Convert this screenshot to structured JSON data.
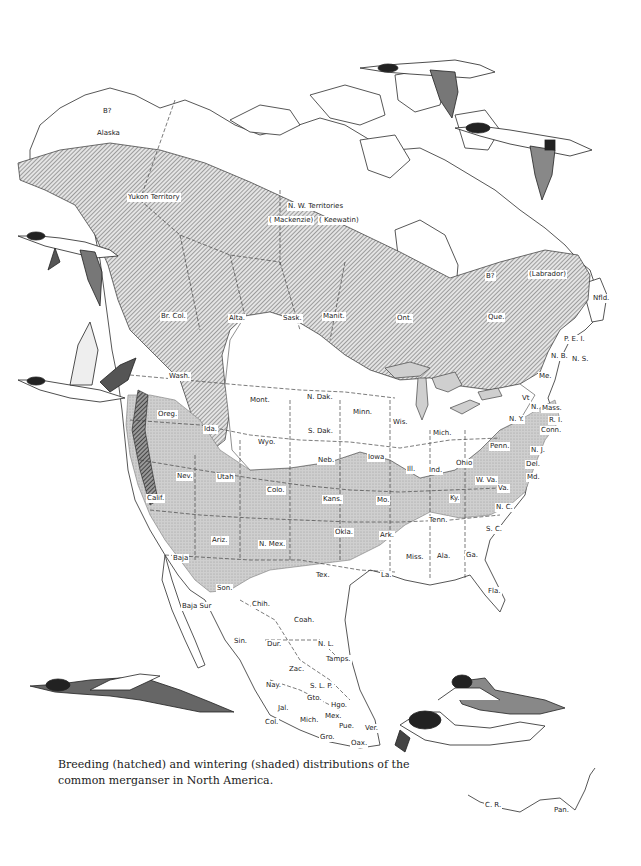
{
  "caption": {
    "line1": "Breeding (hatched) and wintering (shaded) distributions of the",
    "line2": "common merganser in North America."
  },
  "legend": {
    "breeding": {
      "label": "Breeding (hatched)",
      "pattern": "diagonal-hatch",
      "color": "#555555"
    },
    "wintering": {
      "label": "Wintering (shaded)",
      "pattern": "stipple-shade",
      "color": "#c8c8c8"
    }
  },
  "regions": {
    "canada_north": [
      {
        "id": "alaska_q",
        "text": "B?",
        "x": 102,
        "y": 107
      },
      {
        "id": "alaska",
        "text": "Alaska",
        "x": 96,
        "y": 129
      },
      {
        "id": "yukon",
        "text": "Yukon Territory",
        "x": 127,
        "y": 193
      },
      {
        "id": "nwt",
        "text": "N. W. Territories",
        "x": 287,
        "y": 202
      },
      {
        "id": "mackenzie",
        "text": "( Mackenzie)",
        "x": 268,
        "y": 216
      },
      {
        "id": "keewatin",
        "text": "( Keewatin)",
        "x": 318,
        "y": 216
      },
      {
        "id": "hudson_q",
        "text": "B?",
        "x": 485,
        "y": 272
      },
      {
        "id": "labrador",
        "text": "(Labrador)",
        "x": 528,
        "y": 270
      },
      {
        "id": "nfld",
        "text": "Nfld.",
        "x": 592,
        "y": 294
      }
    ],
    "canada_provinces": [
      {
        "id": "brcol",
        "text": "Br. Col.",
        "x": 160,
        "y": 312
      },
      {
        "id": "alta",
        "text": "Alta.",
        "x": 228,
        "y": 314
      },
      {
        "id": "sask",
        "text": "Sask.",
        "x": 282,
        "y": 314
      },
      {
        "id": "manit",
        "text": "Manit.",
        "x": 322,
        "y": 312
      },
      {
        "id": "ont",
        "text": "Ont.",
        "x": 396,
        "y": 314
      },
      {
        "id": "que",
        "text": "Que.",
        "x": 487,
        "y": 313
      },
      {
        "id": "pei",
        "text": "P. E. I.",
        "x": 563,
        "y": 335
      },
      {
        "id": "nb",
        "text": "N. B.",
        "x": 550,
        "y": 352
      },
      {
        "id": "ns",
        "text": "N. S.",
        "x": 571,
        "y": 355
      },
      {
        "id": "me",
        "text": "Me.",
        "x": 538,
        "y": 372
      }
    ],
    "us_states": [
      {
        "id": "wash",
        "text": "Wash.",
        "x": 168,
        "y": 372
      },
      {
        "id": "oreg",
        "text": "Oreg.",
        "x": 157,
        "y": 410
      },
      {
        "id": "ida",
        "text": "Ida.",
        "x": 203,
        "y": 425
      },
      {
        "id": "mont",
        "text": "Mont.",
        "x": 249,
        "y": 396
      },
      {
        "id": "wyo",
        "text": "Wyo.",
        "x": 257,
        "y": 438
      },
      {
        "id": "ndak",
        "text": "N. Dak.",
        "x": 306,
        "y": 393
      },
      {
        "id": "sdak",
        "text": "S. Dak.",
        "x": 307,
        "y": 427
      },
      {
        "id": "minn",
        "text": "Minn.",
        "x": 352,
        "y": 408
      },
      {
        "id": "wis",
        "text": "Wis.",
        "x": 392,
        "y": 418
      },
      {
        "id": "mich",
        "text": "Mich.",
        "x": 432,
        "y": 429
      },
      {
        "id": "vt",
        "text": "Vt",
        "x": 521,
        "y": 394
      },
      {
        "id": "nh",
        "text": "N.",
        "x": 530,
        "y": 403
      },
      {
        "id": "mass",
        "text": "Mass.",
        "x": 541,
        "y": 404
      },
      {
        "id": "ny",
        "text": "N. Y.",
        "x": 508,
        "y": 415
      },
      {
        "id": "ri",
        "text": "R. I.",
        "x": 548,
        "y": 416
      },
      {
        "id": "conn",
        "text": "Conn.",
        "x": 540,
        "y": 426
      },
      {
        "id": "nev",
        "text": "Nev.",
        "x": 176,
        "y": 472
      },
      {
        "id": "utah",
        "text": "Utah",
        "x": 216,
        "y": 473
      },
      {
        "id": "calif",
        "text": "Calif.",
        "x": 146,
        "y": 494
      },
      {
        "id": "colo",
        "text": "Colo.",
        "x": 266,
        "y": 486
      },
      {
        "id": "neb",
        "text": "Neb.",
        "x": 317,
        "y": 456
      },
      {
        "id": "iowa",
        "text": "Iowa",
        "x": 367,
        "y": 453
      },
      {
        "id": "ill",
        "text": "Ill.",
        "x": 406,
        "y": 465
      },
      {
        "id": "ind",
        "text": "Ind.",
        "x": 428,
        "y": 466
      },
      {
        "id": "ohio",
        "text": "Ohio",
        "x": 455,
        "y": 459
      },
      {
        "id": "penn",
        "text": "Penn.",
        "x": 489,
        "y": 442
      },
      {
        "id": "nj",
        "text": "N. J.",
        "x": 530,
        "y": 446
      },
      {
        "id": "del",
        "text": "Del.",
        "x": 525,
        "y": 460
      },
      {
        "id": "md",
        "text": "Md.",
        "x": 526,
        "y": 473
      },
      {
        "id": "wva",
        "text": "W. Va.",
        "x": 475,
        "y": 476
      },
      {
        "id": "va",
        "text": "Va.",
        "x": 497,
        "y": 484
      },
      {
        "id": "kans",
        "text": "Kans.",
        "x": 322,
        "y": 495
      },
      {
        "id": "mo",
        "text": "Mo.",
        "x": 376,
        "y": 496
      },
      {
        "id": "ky",
        "text": "Ky.",
        "x": 449,
        "y": 494
      },
      {
        "id": "tenn",
        "text": "Tenn.",
        "x": 428,
        "y": 516
      },
      {
        "id": "nc",
        "text": "N. C.",
        "x": 495,
        "y": 503
      },
      {
        "id": "sc",
        "text": "S. C.",
        "x": 485,
        "y": 525
      },
      {
        "id": "ariz",
        "text": "Ariz.",
        "x": 211,
        "y": 536
      },
      {
        "id": "nmex",
        "text": "N. Mex.",
        "x": 258,
        "y": 540
      },
      {
        "id": "okla",
        "text": "Okla.",
        "x": 334,
        "y": 528
      },
      {
        "id": "ark",
        "text": "Ark.",
        "x": 379,
        "y": 531
      },
      {
        "id": "miss",
        "text": "Miss.",
        "x": 405,
        "y": 553
      },
      {
        "id": "ala",
        "text": "Ala.",
        "x": 436,
        "y": 552
      },
      {
        "id": "ga",
        "text": "Ga.",
        "x": 465,
        "y": 551
      },
      {
        "id": "tex",
        "text": "Tex.",
        "x": 315,
        "y": 571
      },
      {
        "id": "la",
        "text": "La.",
        "x": 380,
        "y": 571
      },
      {
        "id": "fla",
        "text": "Fla.",
        "x": 487,
        "y": 587
      }
    ],
    "mexico": [
      {
        "id": "baja",
        "text": "Baja",
        "x": 172,
        "y": 554
      },
      {
        "id": "son",
        "text": "Son.",
        "x": 216,
        "y": 584
      },
      {
        "id": "chih",
        "text": "Chih.",
        "x": 251,
        "y": 600
      },
      {
        "id": "bajasur",
        "text": "Baja Sur",
        "x": 181,
        "y": 602
      },
      {
        "id": "coah",
        "text": "Coah.",
        "x": 293,
        "y": 616
      },
      {
        "id": "sin",
        "text": "Sin.",
        "x": 233,
        "y": 637
      },
      {
        "id": "dur",
        "text": "Dur.",
        "x": 266,
        "y": 640
      },
      {
        "id": "nl",
        "text": "N. L.",
        "x": 317,
        "y": 640
      },
      {
        "id": "tamps",
        "text": "Tamps.",
        "x": 325,
        "y": 655
      },
      {
        "id": "zac",
        "text": "Zac.",
        "x": 288,
        "y": 665
      },
      {
        "id": "nay",
        "text": "Nay.",
        "x": 265,
        "y": 681
      },
      {
        "id": "slp",
        "text": "S. L. P.",
        "x": 309,
        "y": 682
      },
      {
        "id": "gto",
        "text": "Gto.",
        "x": 306,
        "y": 694
      },
      {
        "id": "hgo",
        "text": "Hgo.",
        "x": 330,
        "y": 701
      },
      {
        "id": "jal",
        "text": "Jal.",
        "x": 277,
        "y": 704
      },
      {
        "id": "mex",
        "text": "Mex.",
        "x": 324,
        "y": 712
      },
      {
        "id": "col",
        "text": "Col.",
        "x": 264,
        "y": 718
      },
      {
        "id": "mich_mx",
        "text": "Mich.",
        "x": 299,
        "y": 716
      },
      {
        "id": "pue",
        "text": "Pue.",
        "x": 338,
        "y": 722
      },
      {
        "id": "ver",
        "text": "Ver.",
        "x": 364,
        "y": 724
      },
      {
        "id": "gro",
        "text": "Gro.",
        "x": 319,
        "y": 733
      },
      {
        "id": "oax",
        "text": "Oax.",
        "x": 350,
        "y": 739
      }
    ],
    "central_america": [
      {
        "id": "cr",
        "text": "C. R.",
        "x": 484,
        "y": 801
      },
      {
        "id": "pan",
        "text": "Pan.",
        "x": 553,
        "y": 806
      }
    ]
  },
  "illustrations": [
    {
      "id": "merganser-flying-top-1",
      "desc": "male common merganser in flight"
    },
    {
      "id": "merganser-flying-top-2",
      "desc": "male common merganser in flight"
    },
    {
      "id": "merganser-flying-left-1",
      "desc": "male common merganser in flight"
    },
    {
      "id": "merganser-flying-left-2",
      "desc": "male common merganser in flight, wings raised"
    },
    {
      "id": "merganser-flying-bottom-left",
      "desc": "male common merganser gliding"
    },
    {
      "id": "merganser-pair-swimming",
      "desc": "female and male swimming, male holding fish"
    }
  ]
}
